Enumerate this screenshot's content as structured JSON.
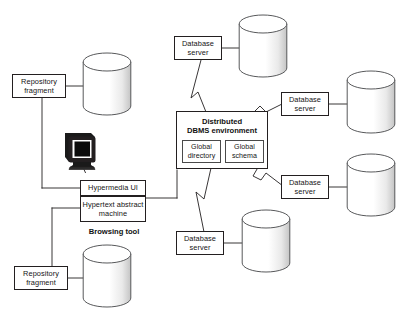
{
  "diagram": {
    "background_color": "#ffffff",
    "line_color": "#231f20",
    "nodes": {
      "repository_fragment_top": {
        "label": "Repository\nfragment",
        "line1": "Repository",
        "line2": "fragment"
      },
      "repository_fragment_bottom": {
        "label": "Repository\nfragment",
        "line1": "Repository",
        "line2": "fragment"
      },
      "hypermedia_ui": {
        "label": "Hypermedia UI"
      },
      "hypertext_abstract_machine": {
        "line1": "Hypertext abstract",
        "line2": "machine"
      },
      "browsing_tool": {
        "label": "Browsing tool"
      },
      "dbms_environment": {
        "line1": "Distributed",
        "line2": "DBMS environment"
      },
      "global_directory": {
        "line1": "Global",
        "line2": "directory"
      },
      "global_schema": {
        "line1": "Global",
        "line2": "schema"
      },
      "database_server_top": {
        "line1": "Database",
        "line2": "server"
      },
      "database_server_right_upper": {
        "line1": "Database",
        "line2": "server"
      },
      "database_server_right_lower": {
        "line1": "Database",
        "line2": "server"
      },
      "database_server_bottom": {
        "line1": "Database",
        "line2": "server"
      }
    },
    "icons": {
      "workstation": "computer-monitor-icon",
      "database_cylinder": "database-cylinder-icon",
      "zigzag": "network-zigzag-connector-icon"
    },
    "cylinders": [
      {
        "name": "cylinder-top-left"
      },
      {
        "name": "cylinder-bottom-left"
      },
      {
        "name": "cylinder-top-center"
      },
      {
        "name": "cylinder-right-upper"
      },
      {
        "name": "cylinder-right-lower"
      },
      {
        "name": "cylinder-bottom-center"
      }
    ]
  }
}
